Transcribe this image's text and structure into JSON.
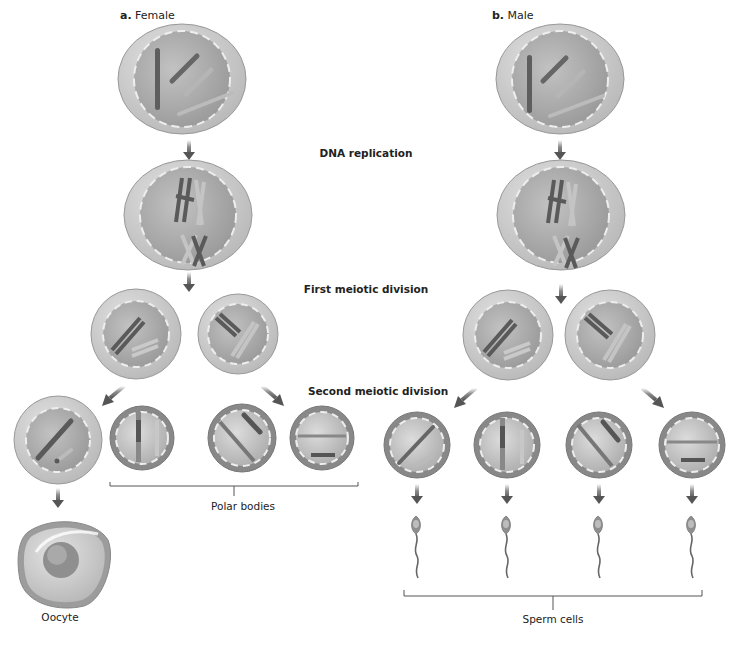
{
  "figure": {
    "panel_a": {
      "letter": "a.",
      "title": "Female"
    },
    "panel_b": {
      "letter": "b.",
      "title": "Male"
    },
    "stages": {
      "dna_replication": "DNA replication",
      "first_division": "First meiotic division",
      "second_division": "Second meiotic division"
    },
    "captions": {
      "polar_bodies": "Polar bodies",
      "oocyte": "Oocyte",
      "sperm_cells": "Sperm cells"
    },
    "colors": {
      "cell_outer": "#cfcfcf",
      "cell_inner": "#a9a9a9",
      "chromosome_dark": "#555555",
      "chromosome_light": "#bdbdbd",
      "arrow": "#5a5a5a",
      "bracket": "#555555"
    }
  }
}
